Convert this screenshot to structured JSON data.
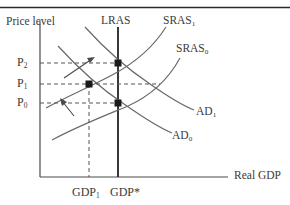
{
  "figure": {
    "type": "as-ad-macroeconomic-diagram",
    "top_rule": true
  },
  "axes": {
    "y_label": "Price level",
    "x_label": "Real GDP",
    "origin": {
      "x": 40,
      "y": 177
    },
    "x_axis_end": {
      "x": 228,
      "y": 177
    },
    "y_axis_top": {
      "x": 40,
      "y": 22
    }
  },
  "price_ticks": [
    {
      "id": "P2",
      "text": "P",
      "sub": "2",
      "y": 63
    },
    {
      "id": "P1",
      "text": "P",
      "sub": "1",
      "y": 84
    },
    {
      "id": "P0",
      "text": "P",
      "sub": "0",
      "y": 103
    }
  ],
  "output_ticks": [
    {
      "id": "GDP1",
      "text": "GDP",
      "sub": "1",
      "x": 89
    },
    {
      "id": "GDPstar",
      "text": "GDP*",
      "sub": "",
      "x": 118
    }
  ],
  "curves": [
    {
      "id": "LRAS",
      "label": "LRAS",
      "sub": "",
      "label_x": 101,
      "label_y": 22
    },
    {
      "id": "SRAS1",
      "label": "SRAS",
      "sub": "1",
      "label_x": 163,
      "label_y": 22
    },
    {
      "id": "SRAS0",
      "label": "SRAS",
      "sub": "0",
      "label_x": 176,
      "label_y": 50
    },
    {
      "id": "AD1",
      "label": "AD",
      "sub": "1",
      "label_x": 196,
      "label_y": 113
    },
    {
      "id": "AD0",
      "label": "AD",
      "sub": "0",
      "label_x": 172,
      "label_y": 137
    }
  ],
  "equilibria": [
    {
      "id": "E2",
      "x": 118,
      "y": 63,
      "desc": "long-run equilibrium at P2 and GDP*"
    },
    {
      "id": "E1",
      "x": 89,
      "y": 84,
      "desc": "short-run equilibrium at P1 and GDP1"
    },
    {
      "id": "E0",
      "x": 118,
      "y": 103,
      "desc": "initial equilibrium at P0 and GDP*"
    }
  ],
  "shift_arrows": [
    {
      "id": "sras-shift-arrow",
      "x1": 64,
      "y1": 78,
      "x2": 94,
      "y2": 58,
      "desc": "SRAS shifts up-left"
    },
    {
      "id": "ad-shift-arrow",
      "x1": 73,
      "y1": 115,
      "x2": 61,
      "y2": 100,
      "desc": "AD shift arrow"
    }
  ],
  "colors": {
    "ink": "#3a3a3a",
    "curve": "#555555",
    "dashed": "#555555",
    "rule": "#2b2b2b"
  }
}
